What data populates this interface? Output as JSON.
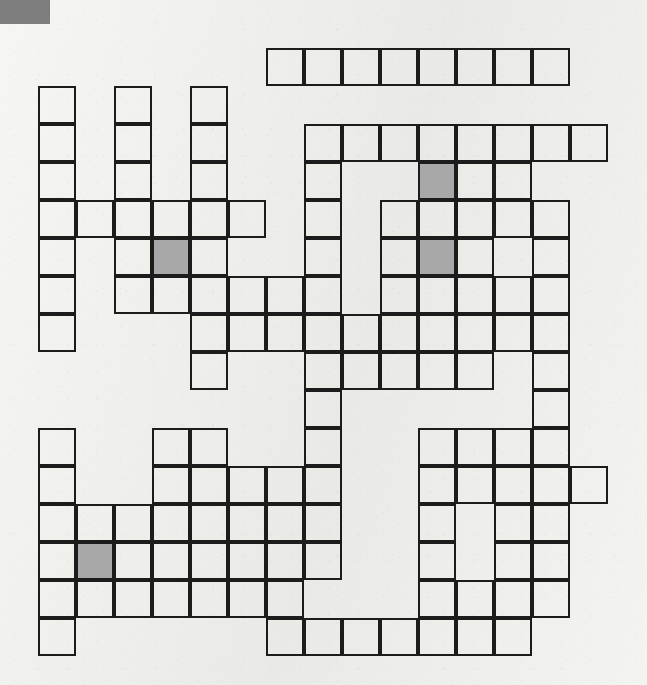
{
  "page": {
    "type": "crossword-grid",
    "background_color": "#eeeeea",
    "corner_mark_color": "#7d7d7d",
    "cell_border_color": "#1c1c1c",
    "shaded_cell_color": "#a8a8a8"
  },
  "grid": {
    "columns": 15,
    "rows": 16,
    "cell_size": 38,
    "origin_x": 38,
    "origin_y": 48,
    "border_width": 2,
    "shaded_cells": [
      {
        "row": 6,
        "col": 4
      },
      {
        "row": 4,
        "col": 11
      },
      {
        "row": 6,
        "col": 11
      },
      {
        "row": 14,
        "col": 2
      }
    ],
    "filled_cells_by_row": [
      {
        "row": 1,
        "cols": [
          7,
          8,
          9,
          10,
          11,
          12,
          13,
          14
        ]
      },
      {
        "row": 2,
        "cols": [
          1,
          3,
          5
        ]
      },
      {
        "row": 3,
        "cols": [
          1,
          3,
          5,
          8,
          9,
          10,
          11,
          12,
          13,
          14,
          15
        ]
      },
      {
        "row": 4,
        "cols": [
          1,
          3,
          5,
          8,
          11,
          12,
          13
        ]
      },
      {
        "row": 5,
        "cols": [
          1,
          2,
          3,
          4,
          5,
          6,
          8,
          10,
          11,
          12,
          13,
          14
        ]
      },
      {
        "row": 6,
        "cols": [
          1,
          3,
          4,
          5,
          8,
          10,
          11,
          12,
          14
        ]
      },
      {
        "row": 7,
        "cols": [
          1,
          3,
          4,
          5,
          6,
          7,
          8,
          10,
          11,
          12,
          13,
          14
        ]
      },
      {
        "row": 8,
        "cols": [
          1,
          5,
          6,
          7,
          8,
          9,
          10,
          11,
          12,
          13,
          14
        ]
      },
      {
        "row": 9,
        "cols": [
          5,
          8,
          9,
          10,
          11,
          12,
          14
        ]
      },
      {
        "row": 10,
        "cols": [
          8,
          14
        ]
      },
      {
        "row": 11,
        "cols": [
          1,
          4,
          5,
          8,
          11,
          12,
          13,
          14
        ]
      },
      {
        "row": 12,
        "cols": [
          1,
          4,
          5,
          6,
          7,
          8,
          11,
          12,
          13,
          14,
          15
        ]
      },
      {
        "row": 13,
        "cols": [
          1,
          2,
          3,
          4,
          5,
          6,
          7,
          8,
          11,
          13,
          14
        ]
      },
      {
        "row": 14,
        "cols": [
          1,
          2,
          3,
          4,
          5,
          6,
          7,
          8,
          11,
          13,
          14
        ]
      },
      {
        "row": 15,
        "cols": [
          1,
          2,
          3,
          4,
          5,
          6,
          7,
          11,
          12,
          13,
          14
        ]
      },
      {
        "row": 16,
        "cols": [
          1,
          7,
          8,
          9,
          10,
          11,
          12,
          13
        ]
      }
    ]
  }
}
